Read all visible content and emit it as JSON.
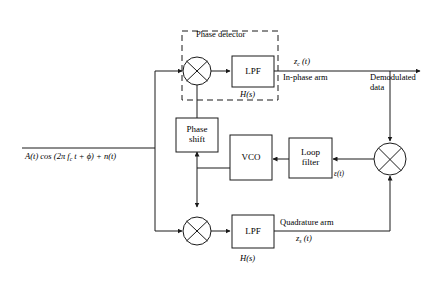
{
  "diagram": {
    "stroke_color": "#1a1a1a",
    "background_color": "#ffffff",
    "blocks": {
      "phase_detector_group": "Phase detector",
      "lpf_top": "LPF",
      "lpf_top_transfer": "H(s)",
      "lpf_bottom": "LPF",
      "lpf_bottom_transfer": "H(s)",
      "phase_shift_line1": "Phase",
      "phase_shift_line2": "shift",
      "vco": "VCO",
      "loop_filter_line1": "Loop",
      "loop_filter_line2": "filter"
    },
    "signals": {
      "input": "A(t) cos (2π f",
      "input_sub": "c",
      "input_tail": " t + ϕ) + n(t)",
      "z_c_base": "z",
      "z_c_sub": "c",
      "z_c_tail": " (t)",
      "z_s_base": "z",
      "z_s_sub": "s",
      "z_s_tail": " (t)",
      "epsilon": "ε(t)",
      "in_phase_arm": "In-phase arm",
      "quadrature_arm": "Quadrature arm",
      "output_line1": "Demodulated",
      "output_line2": "data"
    },
    "multipliers": {
      "top": "×",
      "bottom": "×",
      "right": "×"
    }
  }
}
